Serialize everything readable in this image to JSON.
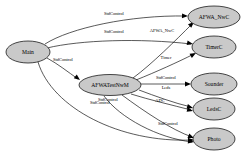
{
  "diagram": {
    "background_color": "#ffffff",
    "node_fill_color": "#c9c9c9",
    "node_stroke_color": "#000000",
    "edge_color": "#000000"
  },
  "nodes": [
    {
      "id": "main",
      "label": "Main",
      "cx": 28,
      "cy": 52,
      "rx": 22,
      "ry": 11
    },
    {
      "id": "afwatestnwm",
      "label": "AFWATestNwM",
      "cx": 110,
      "cy": 85,
      "rx": 31,
      "ry": 10.5
    },
    {
      "id": "afwa_nwc",
      "label": "AFWA_NwC",
      "cx": 214,
      "cy": 17,
      "rx": 26,
      "ry": 11
    },
    {
      "id": "timerc",
      "label": "TimerC",
      "cx": 214,
      "cy": 47,
      "rx": 22,
      "ry": 11
    },
    {
      "id": "sounder",
      "label": "Sounder",
      "cx": 214,
      "cy": 84,
      "rx": 23,
      "ry": 11
    },
    {
      "id": "ledsc",
      "label": "LedsC",
      "cx": 214,
      "cy": 109,
      "rx": 21,
      "ry": 11
    },
    {
      "id": "photo",
      "label": "Photo",
      "cx": 214,
      "cy": 139,
      "rx": 21,
      "ry": 11
    }
  ],
  "edges": [
    {
      "id": "main-to-afwa_nwc",
      "from": "Main",
      "to": "AFWA_NwC",
      "label": "StdControl",
      "label_x": 114,
      "label_y": 14,
      "path": "M 45,44 C 70,28 130,15 186,16",
      "arrow_x": 188,
      "arrow_y": 16,
      "arrow_angle": 2
    },
    {
      "id": "main-to-timerc",
      "from": "Main",
      "to": "TimerC",
      "label": "StdControl",
      "label_x": 114,
      "label_y": 32,
      "path": "M 47,48 C 80,40 140,38 191,44",
      "arrow_x": 193,
      "arrow_y": 44,
      "arrow_angle": 12
    },
    {
      "id": "main-to-afwatestnwm",
      "from": "Main",
      "to": "AFWATestNwM",
      "label": "StdControl",
      "label_x": 63,
      "label_y": 60,
      "path": "M 47,58 C 58,64 68,72 78,79",
      "arrow_x": 80,
      "arrow_y": 80,
      "arrow_angle": 38
    },
    {
      "id": "main-to-photo",
      "from": "Main",
      "to": "Photo",
      "label": "StdControl",
      "label_x": 100,
      "label_y": 103,
      "path": "M 38,62 C 52,108 120,143 192,140",
      "arrow_x": 194,
      "arrow_y": 140,
      "arrow_angle": -2
    },
    {
      "id": "afwatestnwm-to-afwa_nwc",
      "from": "AFWATestNwM",
      "to": "AFWA_NwC",
      "label": "AFWA_NwC",
      "label_x": 162,
      "label_y": 31,
      "path": "M 133,78 C 152,64 176,40 192,24",
      "arrow_x": 194,
      "arrow_y": 22,
      "arrow_angle": -43
    },
    {
      "id": "afwatestnwm-to-timerc",
      "from": "AFWATestNwM",
      "to": "TimerC",
      "label": "Timer",
      "label_x": 166,
      "label_y": 58,
      "path": "M 136,80 C 156,72 178,62 194,54",
      "arrow_x": 196,
      "arrow_y": 53,
      "arrow_angle": -28
    },
    {
      "id": "afwatestnwm-to-sounder",
      "from": "AFWATestNwM",
      "to": "Sounder",
      "label": "StdControl",
      "label_x": 166,
      "label_y": 78,
      "path": "M 141,84 L 189,84",
      "arrow_x": 191,
      "arrow_y": 84,
      "arrow_angle": 0
    },
    {
      "id": "afwatestnwm-to-ledsc",
      "from": "AFWATestNwM",
      "to": "LedsC",
      "label": "Leds",
      "label_x": 166,
      "label_y": 88,
      "path": "M 139,90 C 155,96 174,103 191,107",
      "arrow_x": 193,
      "arrow_y": 108,
      "arrow_angle": 16
    },
    {
      "id": "afwatestnwm-to-ledsc-adc",
      "from": "AFWATestNwM",
      "to": "LedsC",
      "label": "ADC",
      "label_x": 160,
      "label_y": 101,
      "path": "M 131,94 C 150,100 172,105 191,110",
      "arrow_x": 193,
      "arrow_y": 111,
      "arrow_angle": 15
    },
    {
      "id": "afwatestnwm-to-photo",
      "from": "AFWATestNwM",
      "to": "Photo",
      "label": "StdControl",
      "label_x": 168,
      "label_y": 124,
      "path": "M 122,95 C 145,112 172,130 192,137",
      "arrow_x": 194,
      "arrow_y": 138,
      "arrow_angle": 22
    },
    {
      "id": "afwatestnwm-stdcontrol-self",
      "from": "AFWATestNwM",
      "to": "Photo",
      "label": "StdControl",
      "label_x": 108,
      "label_y": 100,
      "path": "M 104,96 C 120,118 158,138 192,142",
      "arrow_x": 194,
      "arrow_y": 142,
      "arrow_angle": 8
    }
  ]
}
